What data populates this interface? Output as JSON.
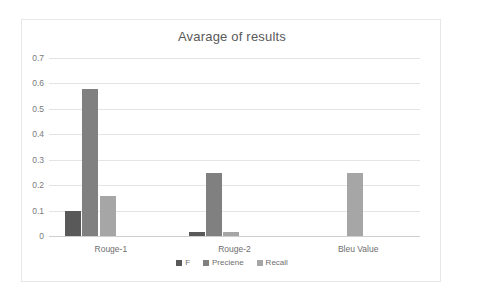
{
  "chart_data": {
    "type": "bar",
    "title": "Avarage of results",
    "xlabel": "",
    "ylabel": "",
    "categories": [
      "Rouge-1",
      "Rouge-2",
      "Bleu Value"
    ],
    "series": [
      {
        "name": "F",
        "color": "#595959",
        "values": [
          0.1,
          0.017,
          0
        ]
      },
      {
        "name": "Preciene",
        "color": "#808080",
        "values": [
          0.578,
          0.248,
          0
        ]
      },
      {
        "name": "Recall",
        "color": "#a6a6a6",
        "values": [
          0.157,
          0.016,
          0.247
        ]
      }
    ],
    "ylim": [
      0,
      0.7
    ],
    "yticks": [
      0,
      0.1,
      0.2,
      0.3,
      0.4,
      0.5,
      0.6,
      0.7
    ],
    "ytick_labels": [
      "0",
      "0.1",
      "0.2",
      "0.3",
      "0.4",
      "0.5",
      "0.6",
      "0.7"
    ],
    "grid": true,
    "grid_axis": "y",
    "legend": true,
    "legend_position": "bottom"
  },
  "colors": {
    "background": "#ffffff",
    "border": "#e8e8e8",
    "gridline": "#e4e4e4",
    "axis": "#cfcfcf",
    "title_text": "#595959",
    "tick_text": "#7a7a7a"
  }
}
